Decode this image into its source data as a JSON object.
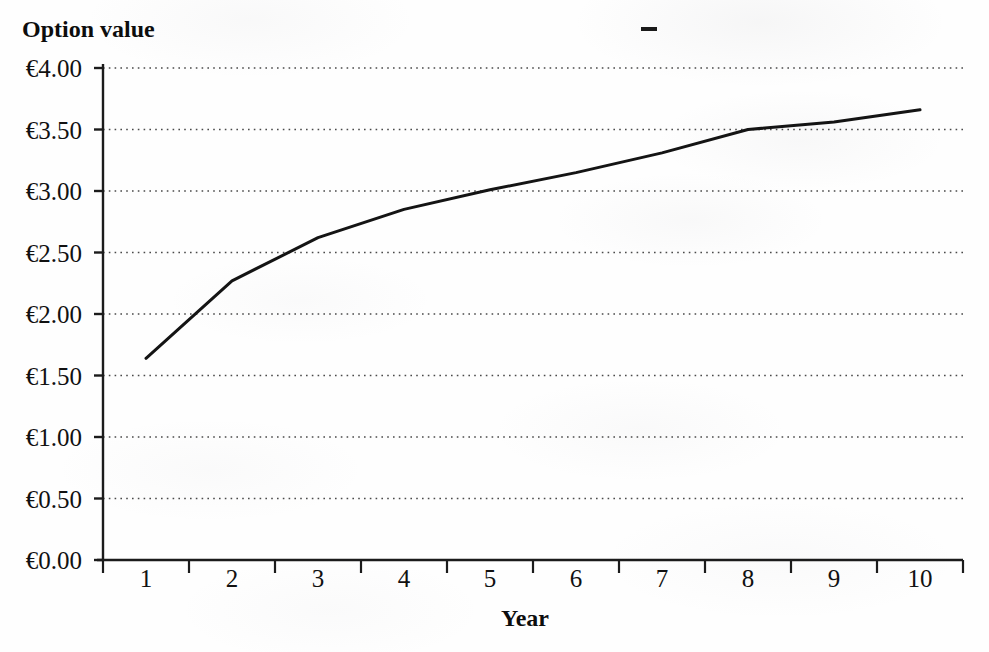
{
  "page": {
    "background_color": "#fefefe",
    "ink_color": "#111111"
  },
  "chart_data": {
    "type": "line",
    "title": "Option value",
    "xlabel": "Year",
    "ylabel": "Option value",
    "categories": [
      "1",
      "2",
      "3",
      "4",
      "5",
      "6",
      "7",
      "8",
      "9",
      "10"
    ],
    "x": [
      1,
      2,
      3,
      4,
      5,
      6,
      7,
      8,
      9,
      10
    ],
    "values": [
      1.64,
      2.27,
      2.62,
      2.85,
      3.01,
      3.15,
      3.31,
      3.5,
      3.56,
      3.66
    ],
    "series": [
      {
        "name": "Option value",
        "values": [
          1.64,
          2.27,
          2.62,
          2.85,
          3.01,
          3.15,
          3.31,
          3.5,
          3.56,
          3.66
        ]
      }
    ],
    "ylim": [
      0,
      4
    ],
    "ytick_step": 0.5,
    "ytick_labels": [
      "€4.00",
      "€3.50",
      "€3.00",
      "€2.50",
      "€2.00",
      "€1.50",
      "€1.00",
      "€0.50",
      "€0.00"
    ],
    "ytick_values": [
      4.0,
      3.5,
      3.0,
      2.5,
      2.0,
      1.5,
      1.0,
      0.5,
      0.0
    ],
    "xlim": [
      0.5,
      10.5
    ],
    "grid": "horizontal-dotted",
    "legend": "none",
    "line_color": "#141414",
    "currency_symbol": "€"
  },
  "artifacts": {
    "stray_dash": "scan-artifact-dash"
  }
}
